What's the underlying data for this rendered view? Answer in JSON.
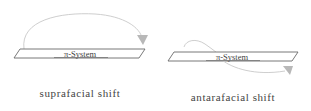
{
  "diagram": {
    "panels": [
      {
        "id": "suprafacial",
        "plane_label": "π-System",
        "caption": "suprafacial shift",
        "arrow_side": "same face (above plane)"
      },
      {
        "id": "antarafacial",
        "plane_label": "π-System",
        "caption": "antarafacial shift",
        "arrow_side": "opposite faces (above to below plane)"
      }
    ],
    "colors": {
      "plane_stroke": "#6a6a6a",
      "arrow": "#c8c8c8",
      "text": "#444444"
    }
  }
}
